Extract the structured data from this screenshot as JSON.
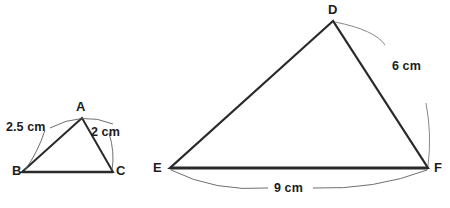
{
  "figure": {
    "type": "geometry-diagram",
    "background_color": "#ffffff",
    "stroke_color": "#2a2a2a",
    "leader_color": "#6b6b6b",
    "label_color": "#1c1c1c",
    "caption_partial": "",
    "shapes": [
      {
        "name": "triangle-abc",
        "vertices": [
          {
            "label": "A",
            "x": 82,
            "y": 118
          },
          {
            "label": "B",
            "x": 22,
            "y": 172
          },
          {
            "label": "C",
            "x": 113,
            "y": 172
          }
        ],
        "measures": [
          {
            "side": "AB",
            "text": "2.5 cm"
          },
          {
            "side": "AC",
            "text": "2 cm"
          }
        ]
      },
      {
        "name": "triangle-def",
        "vertices": [
          {
            "label": "D",
            "x": 333,
            "y": 21
          },
          {
            "label": "E",
            "x": 170,
            "y": 168
          },
          {
            "label": "F",
            "x": 428,
            "y": 168
          }
        ],
        "measures": [
          {
            "side": "DF",
            "text": "6 cm"
          },
          {
            "side": "EF",
            "text": "9 cm"
          }
        ]
      }
    ]
  },
  "labels": {
    "A": "A",
    "B": "B",
    "C": "C",
    "D": "D",
    "E": "E",
    "F": "F",
    "side_ab": "2.5 cm",
    "side_ac": "2 cm",
    "side_df": "6 cm",
    "side_ef": "9 cm"
  }
}
